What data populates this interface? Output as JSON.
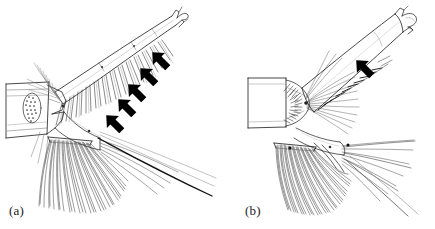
{
  "figure": {
    "kind": "scientific-line-drawing",
    "background_color": "#ffffff",
    "ink_color": "#1a1a1a",
    "arrow_color": "#000000",
    "width": 435,
    "height": 229
  },
  "panels": [
    {
      "id": "a",
      "label": "(a)",
      "label_x": 9,
      "label_y": 203,
      "arrow_count": 5,
      "arrows": [
        {
          "index": 1,
          "x": 160,
          "y": 60,
          "rotation": -45
        },
        {
          "index": 2,
          "x": 148,
          "y": 76,
          "rotation": -45
        },
        {
          "index": 3,
          "x": 136,
          "y": 92,
          "rotation": -45
        },
        {
          "index": 4,
          "x": 126,
          "y": 106,
          "rotation": -45
        },
        {
          "index": 5,
          "x": 114,
          "y": 123,
          "rotation": -45
        }
      ],
      "structures": [
        "basal-segment",
        "stippled-oval-organ",
        "elongate-distal-segment",
        "forked-apex",
        "setal-row",
        "ventral-seta-fan",
        "long-trailing-seta"
      ]
    },
    {
      "id": "b",
      "label": "(b)",
      "label_x": 245,
      "label_y": 203,
      "arrow_count": 1,
      "arrows": [
        {
          "index": 1,
          "x": 364,
          "y": 68,
          "rotation": -45
        }
      ],
      "structures": [
        "basal-segment",
        "elongate-distal-segment",
        "hooked-apex",
        "spine-row",
        "setal-tufts",
        "ventral-seta-fan",
        "long-trailing-seta"
      ]
    }
  ]
}
